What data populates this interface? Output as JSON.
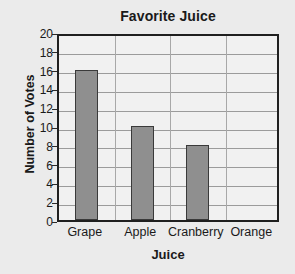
{
  "chart_data": {
    "type": "bar",
    "title": "Favorite Juice",
    "xlabel": "Juice",
    "ylabel": "Number of Votes",
    "categories": [
      "Grape",
      "Apple",
      "Cranberry",
      "Orange"
    ],
    "values": [
      16,
      10,
      8,
      0
    ],
    "ylim": [
      0,
      20
    ],
    "ytick_step": 2,
    "yticks": [
      0,
      2,
      4,
      6,
      8,
      10,
      12,
      14,
      16,
      18,
      20
    ],
    "ytick_labels": [
      "0",
      "2",
      "4",
      "6",
      "8",
      "10",
      "12",
      "14",
      "16",
      "18",
      "20"
    ],
    "grid": true,
    "grid_axis": "y",
    "legend": false,
    "legend_position": "none",
    "colors": {
      "background": "#ebebeb",
      "plot_background": "#f1f1f1",
      "bar_fill": "#8f8f8f",
      "bar_edge": "#3a3a3a",
      "gridline": "#9b9b9b",
      "axis": "#1f1f1f",
      "text": "#1a1a1a"
    }
  }
}
